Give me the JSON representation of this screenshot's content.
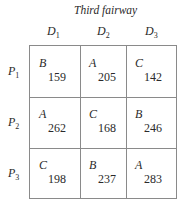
{
  "title": "Third fairway",
  "columns": [
    {
      "label": "D",
      "sub": "1"
    },
    {
      "label": "D",
      "sub": "2"
    },
    {
      "label": "D",
      "sub": "3"
    }
  ],
  "rows": [
    {
      "label": "P",
      "sub": "1",
      "cells": [
        {
          "letter": "B",
          "value": "159"
        },
        {
          "letter": "A",
          "value": "205"
        },
        {
          "letter": "C",
          "value": "142"
        }
      ]
    },
    {
      "label": "P",
      "sub": "2",
      "cells": [
        {
          "letter": "A",
          "value": "262"
        },
        {
          "letter": "C",
          "value": "168"
        },
        {
          "letter": "B",
          "value": "246"
        }
      ]
    },
    {
      "label": "P",
      "sub": "3",
      "cells": [
        {
          "letter": "C",
          "value": "198"
        },
        {
          "letter": "B",
          "value": "237"
        },
        {
          "letter": "A",
          "value": "283"
        }
      ]
    }
  ]
}
